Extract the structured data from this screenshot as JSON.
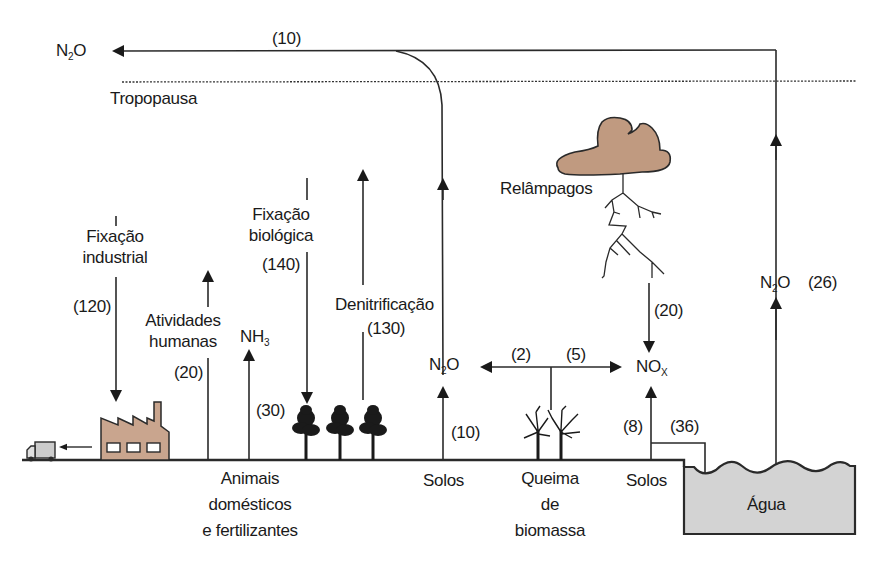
{
  "diagram": {
    "title_region": {
      "n2o_stratosphere": {
        "base": "N",
        "sub": "2",
        "tail": "O"
      },
      "top_flux": "(10)",
      "tropopause": "Tropopausa"
    },
    "lightning": {
      "label": "Relâmpagos",
      "flux": "(20)",
      "product": {
        "base": "NO",
        "sub": "X"
      }
    },
    "water_emission": {
      "species": {
        "base": "N",
        "sub": "2",
        "tail": "O"
      },
      "flux": "(26)"
    },
    "industrial_fixation": {
      "label_line1": "Fixação",
      "label_line2": "industrial",
      "flux": "(120)"
    },
    "human_activities": {
      "label_line1": "Atividades",
      "label_line2": "humanas",
      "flux": "(20)"
    },
    "ammonia": {
      "species": {
        "base": "NH",
        "sub": "3"
      },
      "flux": "(30)"
    },
    "biological_fixation": {
      "label_line1": "Fixação",
      "label_line2": "biológica",
      "flux": "(140)"
    },
    "denitrification": {
      "label": "Denitrificação",
      "flux": "(130)"
    },
    "soil_n2o": {
      "species": {
        "base": "N",
        "sub": "2",
        "tail": "O"
      },
      "flux": "(10)"
    },
    "biomass_burning": {
      "flux_left": "(2)",
      "flux_right": "(5)"
    },
    "soil_nox": {
      "flux_up": "(8)",
      "flux_to_water": "(36)"
    },
    "ground_labels": {
      "animals_line1": "Animais",
      "animals_line2": "domésticos",
      "animals_line3": "e fertilizantes",
      "soils_1": "Solos",
      "burning_line1": "Queima",
      "burning_line2": "de",
      "burning_line3": "biomassa",
      "soils_2": "Solos",
      "water": "Água"
    },
    "colors": {
      "line": "#2a2a2a",
      "factory_fill": "#c9a58e",
      "cloud_fill": "#c09a80",
      "water_fill": "#d3d3d3",
      "truck_fill": "#cccccc"
    }
  }
}
